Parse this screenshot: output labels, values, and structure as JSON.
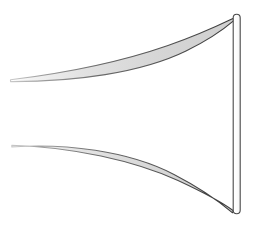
{
  "figure": {
    "title": "",
    "width": 253,
    "height": 227,
    "background_color": "#ffffff"
  },
  "colors": {
    "outline": "#3a3a3a",
    "crescent_fill": "#d9d9d9",
    "crescent_fill_light": "#eeeeee",
    "rod_fill": "#fcfcfc",
    "rod_outline": "#4a4a4a",
    "background": "#ffffff"
  },
  "shapes": {
    "upper_crescent": {
      "label": "upper-crescent",
      "tip_left": [
        10,
        80
      ],
      "tip_right": [
        233,
        19
      ],
      "max_thickness_px": 20,
      "outer_path": "M 10.5 79.5 C 60 74 140 57 200 33 C 215 26 226 21 233.5 18.5",
      "inner_path": "M 233.5 18.5 C 222 27 205 39 182 50 C 140 69 75 79 10.5 79.5",
      "fill": "#d9d9d9",
      "stroke": "#3a3a3a",
      "stroke_width": 1.1
    },
    "lower_crescent": {
      "label": "lower-crescent",
      "tip_left": [
        12,
        145
      ],
      "tip_right": [
        233,
        211
      ],
      "max_thickness_px": 22,
      "outer_path": "M 12 145.5 C 70 148 135 164 180 185 C 208 198 225 207 233.5 211.5",
      "inner_path": "M 233.5 211.5 C 220 200 200 185 172 172 C 125 151 62 144 12 145.5",
      "fill": "#d9d9d9",
      "stroke": "#3a3a3a",
      "stroke_width": 1.1
    },
    "vertical_rod": {
      "label": "vertical-rod",
      "x_left": 233,
      "x_right": 240,
      "y_top": 14,
      "y_bottom": 214,
      "width_px": 7,
      "height_px": 200,
      "corner_radius_px": 3.5,
      "fill": "#fcfcfc",
      "stroke": "#4a4a4a",
      "stroke_width": 1.1
    }
  },
  "annotations": {
    "shape_count": "3",
    "description": "Two tapered crescent curves converging on a vertical rod"
  }
}
